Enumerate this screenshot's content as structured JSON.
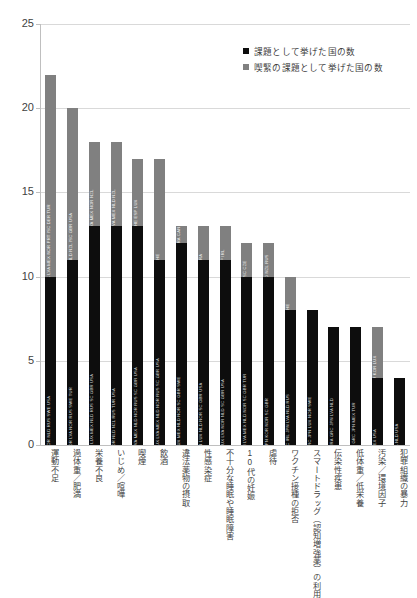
{
  "chart_data": {
    "type": "bar",
    "subtype": "stacked-vertical",
    "title": "",
    "xlabel": "",
    "ylabel": "",
    "ylim": [
      0,
      25
    ],
    "yticks": [
      0,
      5,
      10,
      15,
      20,
      25
    ],
    "grid": true,
    "legend_position": "top-right",
    "categories": [
      "運動不足",
      "過体重／肥満",
      "栄養不良",
      "いじめ／喧嘩",
      "喫煙",
      "飲酒",
      "違法薬物の摂取",
      "性感染症",
      "不十分な睡眠や睡眠障害",
      "10代の妊娠",
      "虐待",
      "ワクチン接種の拒否",
      "スマートドラッグ（認知増強薬）の利用",
      "伝染性疾患",
      "低体重／低栄養",
      "汚染／環境因子",
      "犯罪組織の暴力"
    ],
    "series": [
      {
        "name": "課題として挙げた国の数",
        "color": "#0d0d0d",
        "values": [
          10,
          11,
          13,
          13,
          13,
          11,
          12,
          11,
          11,
          10,
          10,
          8,
          8,
          7,
          7,
          4,
          4
        ]
      },
      {
        "name": "喫緊の課題として挙げた国の数",
        "color": "#808080",
        "values": [
          12,
          9,
          5,
          5,
          4,
          6,
          1,
          2,
          2,
          2,
          2,
          2,
          0,
          0,
          0,
          3,
          0
        ]
      }
    ],
    "totals": [
      22,
      20,
      18,
      18,
      17,
      17,
      13,
      13,
      13,
      12,
      12,
      10,
      8,
      7,
      7,
      7,
      4
    ],
    "bar_country_codes": [
      {
        "category": "運動不足",
        "issue_codes": "CHE FRA GRC JPN KOR NLD RUS SWE USA",
        "urgent_codes": "BEL FLU CAN CZE ESP IRL LUX LVA MEX NOR PRT ISC DER TUR"
      },
      {
        "category": "過体重／肥満",
        "issue_codes": "CAN CZE ESP IRL JPN KOR LVA NOR RUS SWE TUR",
        "urgent_codes": "BEL FLU CHE MEX NLD NZL ISC GBR USA"
      },
      {
        "category": "栄養不良",
        "issue_codes": "BEL FLU BEL IRL FRA GRC JPN LUX MEX NLD RUS SC GBR USA",
        "urgent_codes": "CAN CZE IRL LVA MEX NOR NZL"
      },
      {
        "category": "いじめ／喧嘩",
        "issue_codes": "BEL FLU CHE IRL JPN KOR NLD NZL RUS TUR USA",
        "urgent_codes": "BEL FRA GRC LVA MEX NLD NZL"
      },
      {
        "category": "喫煙",
        "issue_codes": "BEL FLU CAN CZE FRA GRC JPN LVA MEX NLD NOR RUS SC GBR USA",
        "urgent_codes": "BEL FRA CHE ESP LUX"
      },
      {
        "category": "飲酒",
        "issue_codes": "BEL FLU CZE ESP FRA GRC IRL JPN LUX LVA MEX NLD NOR RUS SC GBR USA",
        "urgent_codes": "CHE"
      },
      {
        "category": "違法薬物の摂取",
        "issue_codes": "BEL FLU CHE FRA GRC JPN LUX MEX NLD NOR SC GBR SWE",
        "urgent_codes": "BEL FRA CAN"
      },
      {
        "category": "性感染症",
        "issue_codes": "BEL FLU CAN GRC FRA JPN LUX NLD NOR SC GBR USA",
        "urgent_codes": "FRA"
      },
      {
        "category": "不十分な睡眠や睡眠障害",
        "issue_codes": "BEL FLU CAN GRC IRL JPN LUX LVA NOR NLD SC GBR USA",
        "urgent_codes": "ESP IRL"
      },
      {
        "category": "10代の妊娠",
        "issue_codes": "BEL FLU CAN FRA GRC IRL JPN LVA MEX NLD NOR SC GBR TUR",
        "urgent_codes": "RUS SC CZE"
      },
      {
        "category": "虐待",
        "issue_codes": "BEL FLU FRA GRC JPN KOR NOR SC GBR",
        "urgent_codes": "FRA NLD NZL RUS"
      },
      {
        "category": "ワクチン接種の拒否",
        "issue_codes": "BEL FLU CZE FRA GRC IRL JPN LVA NLD RUS",
        "urgent_codes": "CHE"
      },
      {
        "category": "スマートドラッグ（認知増強薬）の利用",
        "issue_codes": "BEL FLU CAN FRA GRC JPN LUX NOR SWE",
        "urgent_codes": ""
      },
      {
        "category": "伝染性疾患",
        "issue_codes": "BEL FLU CAN CHE FRA GRC JPN LVA NLD",
        "urgent_codes": ""
      },
      {
        "category": "低体重／低栄養",
        "issue_codes": "BEL FLU CAN FRA GRC JPN MEX TUR",
        "urgent_codes": ""
      },
      {
        "category": "汚染／環境因子",
        "issue_codes": "IRL MEX USA",
        "urgent_codes": "BEL FLU KOR LUX"
      },
      {
        "category": "犯罪組織の暴力",
        "issue_codes": "BEL FRA NLD USA",
        "urgent_codes": ""
      }
    ]
  },
  "legend": {
    "items": [
      {
        "label": "課題として挙げた国の数",
        "color": "#0d0d0d"
      },
      {
        "label": "喫緊の課題として挙げた国の数",
        "color": "#808080"
      }
    ]
  },
  "axis": {
    "y_tick_labels": [
      "0",
      "5",
      "10",
      "15",
      "20",
      "25"
    ]
  }
}
